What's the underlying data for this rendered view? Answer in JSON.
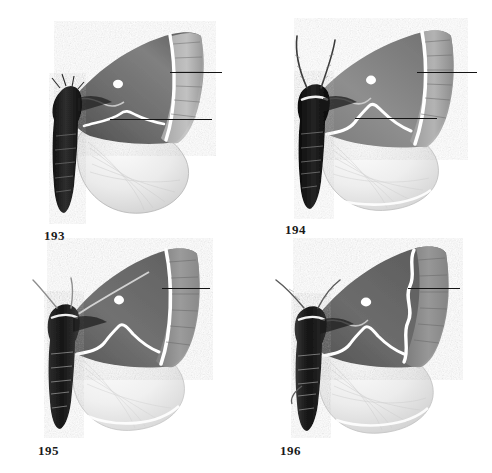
{
  "plate": {
    "title": "Moth specimen plate",
    "background_color": "#ffffff",
    "width": 492,
    "height": 473,
    "figure_count": 4
  },
  "figures": [
    {
      "label": "193",
      "label_x": 44,
      "label_y": 228,
      "specimen": {
        "name": "moth-specimen-193",
        "view": "dorsal, wings spread, left side shown",
        "body_color": "#1f1f1f",
        "forewing_color": "#6e6e6e",
        "hindwing_color": "#e3e3e3",
        "band_color": "#ffffff",
        "has_discal_spot": true,
        "antennae_visible": false
      },
      "leaders": [
        {
          "name": "leader-193-upper",
          "x": 170,
          "y": 72,
          "length": 52
        },
        {
          "name": "leader-193-lower",
          "x": 110,
          "y": 119,
          "length": 102
        }
      ]
    },
    {
      "label": "194",
      "label_x": 285,
      "label_y": 222,
      "specimen": {
        "name": "moth-specimen-194",
        "view": "dorsal, wings spread, left side shown",
        "body_color": "#161616",
        "forewing_color": "#8a8a8a",
        "hindwing_color": "#e8e8e8",
        "band_color": "#ffffff",
        "has_discal_spot": true,
        "antennae_visible": true
      },
      "leaders": [
        {
          "name": "leader-194-upper",
          "x": 417,
          "y": 72,
          "length": 60
        },
        {
          "name": "leader-194-lower",
          "x": 355,
          "y": 118,
          "length": 82
        }
      ]
    },
    {
      "label": "195",
      "label_x": 38,
      "label_y": 443,
      "specimen": {
        "name": "moth-specimen-195",
        "view": "dorsal, wings spread, left side shown",
        "body_color": "#2a2a2a",
        "forewing_color": "#707070",
        "hindwing_color": "#ededed",
        "band_color": "#ffffff",
        "has_discal_spot": true,
        "antennae_visible": true
      },
      "leaders": [
        {
          "name": "leader-195-upper",
          "x": 162,
          "y": 288,
          "length": 48
        }
      ]
    },
    {
      "label": "196",
      "label_x": 280,
      "label_y": 443,
      "specimen": {
        "name": "moth-specimen-196",
        "view": "dorsal, wings spread, left side shown",
        "body_color": "#242424",
        "forewing_color": "#6a6a6a",
        "hindwing_color": "#e6e6e6",
        "band_color": "#ffffff",
        "has_discal_spot": true,
        "antennae_visible": true
      },
      "leaders": [
        {
          "name": "leader-196-upper",
          "x": 408,
          "y": 288,
          "length": 52
        }
      ]
    }
  ]
}
